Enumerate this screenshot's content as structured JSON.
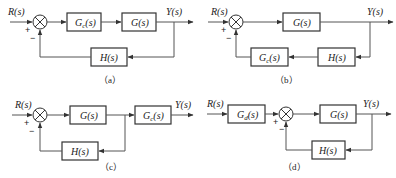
{
  "diagrams": {
    "a": {
      "caption": "（a）",
      "input": "R(s)",
      "output": "Y(s)",
      "forward_blocks": [
        "G_c(s)",
        "G(s)"
      ],
      "feedback_blocks": [
        "H(s)"
      ],
      "plus_sign": "+",
      "minus_sign": "−",
      "gc_main": "G",
      "gc_sub": "c",
      "gc_tail": "(s)",
      "g": "G(s)",
      "h": "H(s)"
    },
    "b": {
      "caption": "（b）",
      "input": "R(s)",
      "output": "Y(s)",
      "forward_blocks": [
        "G(s)"
      ],
      "feedback_blocks": [
        "H(s)",
        "G_c(s)"
      ],
      "plus_sign": "+",
      "minus_sign": "−",
      "gc_main": "G",
      "gc_sub": "c",
      "gc_tail": "(s)",
      "g": "G(s)",
      "h": "H(s)"
    },
    "c": {
      "caption": "（c）",
      "input": "R(s)",
      "output": "Y(s)",
      "forward_blocks": [
        "G(s)",
        "G_c(s)"
      ],
      "feedback_blocks": [
        "H(s)"
      ],
      "plus_sign": "+",
      "minus_sign": "−",
      "gc_main": "G",
      "gc_sub": "c",
      "gc_tail": "(s)",
      "g": "G(s)",
      "h": "H(s)"
    },
    "d": {
      "caption": "（d）",
      "input": "R(s)",
      "output": "Y(s)",
      "prefilter_blocks": [
        "G_d(s)"
      ],
      "forward_blocks": [
        "G(s)"
      ],
      "feedback_blocks": [
        "H(s)"
      ],
      "plus_sign": "+",
      "minus_sign": "−",
      "gd_main": "G",
      "gd_sub": "d",
      "gd_tail": "(s)",
      "g": "G(s)",
      "h": "H(s)"
    }
  }
}
